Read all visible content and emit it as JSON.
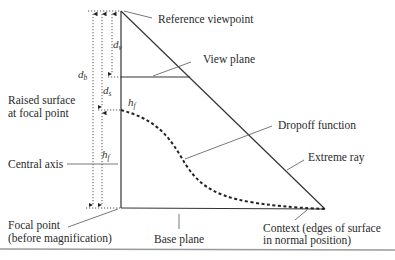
{
  "labels": {
    "reference_viewpoint": "Reference viewpoint",
    "view_plane": "View plane",
    "raised_surface_line1": "Raised surface",
    "raised_surface_line2": "at focal point",
    "dropoff_function": "Dropoff function",
    "extreme_ray": "Extreme ray",
    "central_axis": "Central axis",
    "focal_point_line1": "Focal point",
    "focal_point_line2": "(before magnification)",
    "base_plane": "Base plane",
    "context_line1": "Context (edges of surface",
    "context_line2": "in normal position)"
  },
  "symbols": {
    "d_b": {
      "base": "d",
      "sub": "b"
    },
    "d_v": {
      "base": "d",
      "sub": "v"
    },
    "d_s": {
      "base": "d",
      "sub": "s"
    },
    "h_f_top": {
      "base": "h",
      "sub": "f"
    },
    "h_f_axis": {
      "base": "h",
      "sub": "f"
    }
  },
  "colors": {
    "line": "#333333",
    "leader": "#555555",
    "dotted": "#444444",
    "rule": "#999999"
  }
}
